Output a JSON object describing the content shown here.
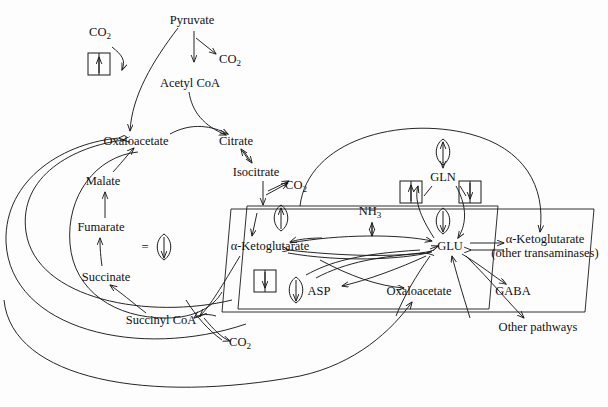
{
  "diagram": {
    "type": "metabolic-pathway",
    "legend": {
      "equals": "=",
      "symbol_name": "oval-down-arrow-glyph"
    },
    "nodes": [
      {
        "id": "co2_top",
        "label": "CO",
        "sub": "2",
        "x": 100,
        "y": 33,
        "compartment": "cytosol"
      },
      {
        "id": "pyruvate",
        "label": "Pyruvate",
        "x": 192,
        "y": 20,
        "compartment": "cytosol"
      },
      {
        "id": "co2_pyr",
        "label": "CO",
        "sub": "2",
        "x": 230,
        "y": 60,
        "compartment": "cytosol"
      },
      {
        "id": "acetylcoa",
        "label": "Acetyl CoA",
        "x": 190,
        "y": 83,
        "compartment": "mitochondrion"
      },
      {
        "id": "oaa_mito",
        "label": "Oxaloacetate",
        "x": 136,
        "y": 141,
        "compartment": "mitochondrion"
      },
      {
        "id": "citrate",
        "label": "Citrate",
        "x": 236,
        "y": 141,
        "compartment": "mitochondrion"
      },
      {
        "id": "isocitrate",
        "label": "Isocitrate",
        "x": 256,
        "y": 172,
        "compartment": "mitochondrion"
      },
      {
        "id": "co2_iso",
        "label": "CO",
        "sub": "2",
        "x": 296,
        "y": 186,
        "compartment": "mitochondrion"
      },
      {
        "id": "malate",
        "label": "Malate",
        "x": 103,
        "y": 181,
        "compartment": "mitochondrion"
      },
      {
        "id": "fumarate",
        "label": "Fumarate",
        "x": 101,
        "y": 227,
        "compartment": "mitochondrion"
      },
      {
        "id": "succinate",
        "label": "Succinate",
        "x": 106,
        "y": 277,
        "compartment": "mitochondrion"
      },
      {
        "id": "succinylcoa",
        "label": "Succinyl CoA",
        "x": 161,
        "y": 320,
        "compartment": "mitochondrion"
      },
      {
        "id": "co2_suc",
        "label": "CO",
        "sub": "2",
        "x": 240,
        "y": 343,
        "compartment": "mitochondrion"
      },
      {
        "id": "akg",
        "label": "α-Ketoglutarate",
        "x": 270,
        "y": 246,
        "compartment": "mitochondrion"
      },
      {
        "id": "nh3",
        "label": "NH",
        "sub": "3",
        "x": 370,
        "y": 212,
        "compartment": "mitochondrion"
      },
      {
        "id": "glu",
        "label": "GLU",
        "x": 450,
        "y": 246,
        "compartment": "mitochondrion"
      },
      {
        "id": "gln",
        "label": "GLN",
        "x": 443,
        "y": 177,
        "compartment": "cytosol"
      },
      {
        "id": "asp",
        "label": "ASP",
        "x": 319,
        "y": 291,
        "compartment": "mitochondrion"
      },
      {
        "id": "oaa_cyt",
        "label": "Oxaloacetate",
        "x": 419,
        "y": 291,
        "compartment": "mitochondrion"
      },
      {
        "id": "akg_trans",
        "label": "α-Ketoglutarate\n(other transaminases)",
        "x": 545,
        "y": 246,
        "compartment": "cytosol"
      },
      {
        "id": "gaba",
        "label": "GABA",
        "x": 513,
        "y": 291,
        "compartment": "cytosol"
      },
      {
        "id": "other_pathways",
        "label": "Other pathways",
        "x": 538,
        "y": 327,
        "compartment": "cytosol"
      }
    ],
    "boxed_arrow_icons": [
      {
        "id": "box_co2_up",
        "name": "boxed-up-arrow-icon",
        "x": 98,
        "y": 64,
        "direction": "up"
      },
      {
        "id": "box_gln_up",
        "name": "boxed-up-arrow-icon",
        "x": 411,
        "y": 192,
        "direction": "up"
      },
      {
        "id": "box_gln_dn",
        "name": "boxed-down-arrow-icon",
        "x": 470,
        "y": 192,
        "direction": "down"
      },
      {
        "id": "box_akg_dn",
        "name": "boxed-down-arrow-icon",
        "x": 265,
        "y": 281,
        "direction": "down"
      }
    ],
    "oval_arrow_icons": [
      {
        "id": "oval_legend",
        "name": "oval-down-arrow-icon",
        "x": 164,
        "y": 247,
        "direction": "down"
      },
      {
        "id": "oval_akg",
        "name": "oval-up-arrow-icon",
        "x": 281,
        "y": 218,
        "direction": "up"
      },
      {
        "id": "oval_gln",
        "name": "oval-up-arrow-icon",
        "x": 443,
        "y": 152,
        "direction": "up"
      },
      {
        "id": "oval_glu",
        "name": "oval-down-arrow-icon",
        "x": 443,
        "y": 221,
        "direction": "down"
      },
      {
        "id": "oval_asp",
        "name": "oval-down-arrow-icon",
        "x": 296,
        "y": 290,
        "direction": "down"
      }
    ],
    "colors": {
      "stroke": "#1a1a1a",
      "text": "#111111",
      "background": "#fdfdfd"
    }
  }
}
